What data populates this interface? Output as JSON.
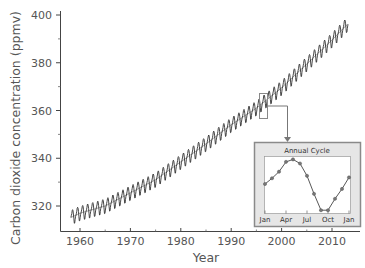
{
  "chart_data": [
    {
      "type": "line",
      "title": "",
      "xlabel": "Year",
      "ylabel": "Carbon dioxide concentration (ppmv)",
      "xlim": [
        1956,
        2015
      ],
      "ylim": [
        311,
        401
      ],
      "x_ticks": [
        1960,
        1970,
        1980,
        1990,
        2000,
        2010
      ],
      "x_minor_ticks": [
        1965,
        1975,
        1985,
        1995,
        2005
      ],
      "y_ticks": [
        320,
        340,
        360,
        380,
        400
      ],
      "y_minor_ticks": [
        330,
        350,
        370,
        390
      ],
      "grid": false,
      "legend": null,
      "series": [
        {
          "name": "Monthly CO2 (seasonal oscillation)",
          "color": "#333333",
          "x": [
            1958,
            1960,
            1965,
            1970,
            1975,
            1980,
            1985,
            1990,
            1995,
            2000,
            2005,
            2010,
            2013
          ],
          "values": [
            315,
            317,
            320,
            325.5,
            331,
            338.5,
            346,
            354,
            361,
            369.5,
            379.5,
            389.5,
            396
          ]
        },
        {
          "name": "Trend",
          "color": "#222222",
          "x": [
            1958,
            1960,
            1965,
            1970,
            1975,
            1980,
            1985,
            1990,
            1995,
            2000,
            2005,
            2010,
            2013
          ],
          "values": [
            315,
            317,
            320,
            325.5,
            331,
            338.5,
            346,
            354,
            361,
            369.5,
            379.5,
            389.5,
            396
          ]
        }
      ],
      "seasonal_amplitude_ppmv": 6,
      "annotations": [
        {
          "type": "highlight_box",
          "x_range": [
            1995.5,
            1997.5
          ],
          "y_range": [
            357,
            367
          ],
          "points_to": "inset"
        }
      ]
    },
    {
      "type": "line",
      "title": "Annual Cycle",
      "categories": [
        "Jan",
        "Feb",
        "Mar",
        "Apr",
        "May",
        "Jun",
        "Jul",
        "Aug",
        "Sep",
        "Oct",
        "Nov",
        "Dec",
        "Jan"
      ],
      "tick_labels": [
        "Jan",
        "Apr",
        "Jul",
        "Oct",
        "Jan"
      ],
      "values": [
        0.0,
        0.7,
        1.5,
        2.7,
        3.0,
        2.5,
        1.0,
        -1.2,
        -3.2,
        -3.2,
        -1.8,
        -0.6,
        0.8
      ],
      "ylabel": "",
      "xlabel": "",
      "grid": false,
      "markers": true,
      "units": "relative ppmv (approx.)"
    }
  ],
  "labels": {
    "ylabel": "Carbon dioxide concentration (ppmv)",
    "xlabel": "Year",
    "inset_title": "Annual Cycle",
    "y_ticks": [
      "320",
      "340",
      "360",
      "380",
      "400"
    ],
    "x_ticks": [
      "1960",
      "1970",
      "1980",
      "1990",
      "2000",
      "2010"
    ],
    "inset_ticks": [
      "Jan",
      "Apr",
      "Jul",
      "Oct",
      "Jan"
    ]
  },
  "colors": {
    "line": "#333333",
    "axis": "#444444",
    "inset_frame": "#888888",
    "inset_bg": "#e6e6e6",
    "marker": "#777777"
  }
}
